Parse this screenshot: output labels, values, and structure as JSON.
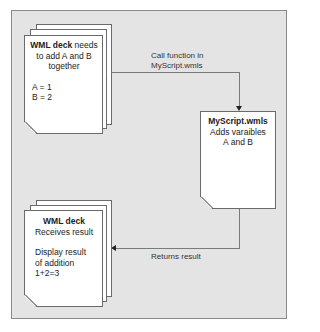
{
  "diagram": {
    "nodes": [
      {
        "id": "wml-deck-start",
        "shape": "document-stack",
        "title": "WML deck",
        "title_suffix": " needs",
        "lines": [
          "to add A and B",
          "together"
        ],
        "values": [
          "A = 1",
          "B = 2"
        ]
      },
      {
        "id": "myscript",
        "shape": "document",
        "title": "MyScript.wmls",
        "lines": [
          "Adds varaibles",
          "A and B"
        ]
      },
      {
        "id": "wml-deck-result",
        "shape": "document-stack",
        "title": "WML deck",
        "subtitle": "Receives result",
        "lines": [
          "Display result",
          "of addition",
          "1+2=3"
        ]
      }
    ],
    "edges": [
      {
        "from": "wml-deck-start",
        "to": "myscript",
        "label_line1": "Call function in",
        "label_line2": "MyScript.wmls"
      },
      {
        "from": "myscript",
        "to": "wml-deck-result",
        "label": "Returns result"
      }
    ]
  },
  "colors": {
    "panel_bg": "#e4e4e4",
    "page_bg": "#ffffff",
    "line": "#7a7a7a",
    "arrowhead": "#222222"
  }
}
